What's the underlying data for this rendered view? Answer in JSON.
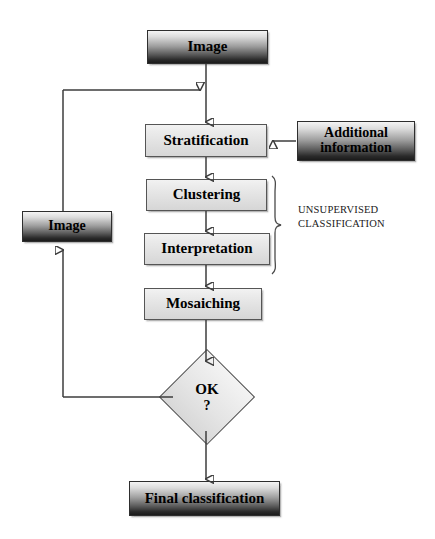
{
  "diagram": {
    "background_color": "#ffffff",
    "line_color": "#3d3d3d"
  },
  "nodes": {
    "image_top": {
      "label": "Image",
      "style": "dark-gradient"
    },
    "stratification": {
      "label": "Stratification",
      "style": "light"
    },
    "additional_information": {
      "label_line1": "Additional",
      "label_line2": "information",
      "style": "dark-gradient"
    },
    "clustering": {
      "label": "Clustering",
      "style": "light"
    },
    "interpretation": {
      "label": "Interpretation",
      "style": "light"
    },
    "mosaiching": {
      "label": "Mosaiching",
      "style": "light"
    },
    "image_left": {
      "label": "Image",
      "style": "dark-gradient"
    },
    "decision_ok": {
      "label": "OK",
      "label2": "?",
      "style": "diamond"
    },
    "final_classification": {
      "label": "Final classification",
      "style": "dark-gradient"
    }
  },
  "annotations": {
    "unsupervised": {
      "line1": "UNSUPERVISED",
      "line2": "CLASSIFICATION"
    }
  },
  "icons": {
    "arrow_down": "arrow-down-icon",
    "arrow_left": "arrow-left-icon",
    "arrow_up": "arrow-up-icon",
    "arrow_right": "arrow-right-icon",
    "brace": "curly-brace-icon"
  }
}
